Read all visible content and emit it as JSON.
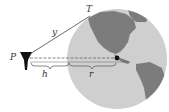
{
  "diagram": {
    "type": "geometry-earth-tangent",
    "labels": {
      "point_p": "P",
      "point_t": "T",
      "tangent_length": "y",
      "height": "h",
      "radius": "r"
    },
    "colors": {
      "ocean": "#c8c8c8",
      "land": "#7a7a7a",
      "line": "#444444",
      "tower": "#111111"
    }
  }
}
